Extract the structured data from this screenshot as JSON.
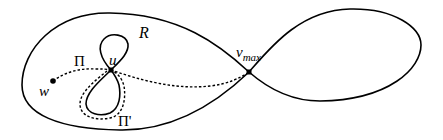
{
  "diagram": {
    "colors": {
      "stroke": "#000000",
      "background": "#ffffff"
    },
    "labels": {
      "region": "R",
      "path": "Π",
      "path_prime": "Π'",
      "vertex_u": "u",
      "vertex_w": "w",
      "vertex_vmax_base": "v",
      "vertex_vmax_sub": "max"
    },
    "nodes": [
      {
        "id": "w",
        "x": 53,
        "y": 81
      },
      {
        "id": "u",
        "x": 111,
        "y": 70
      },
      {
        "id": "v_max",
        "x": 249,
        "y": 72
      }
    ],
    "curves": [
      {
        "id": "outer-figure-eight",
        "style": "solid",
        "description": "Closed curve with left lobe enclosing region R and right lobe, self-crossing at v_max"
      },
      {
        "id": "inner-figure-eight",
        "style": "solid",
        "description": "Small figure-eight self-crossing at u"
      },
      {
        "id": "path-pi",
        "style": "dashed",
        "description": "Path Π from w through u to v_max"
      },
      {
        "id": "path-pi-prime",
        "style": "dashed",
        "description": "Path Π' around the lower loop at u"
      }
    ]
  }
}
